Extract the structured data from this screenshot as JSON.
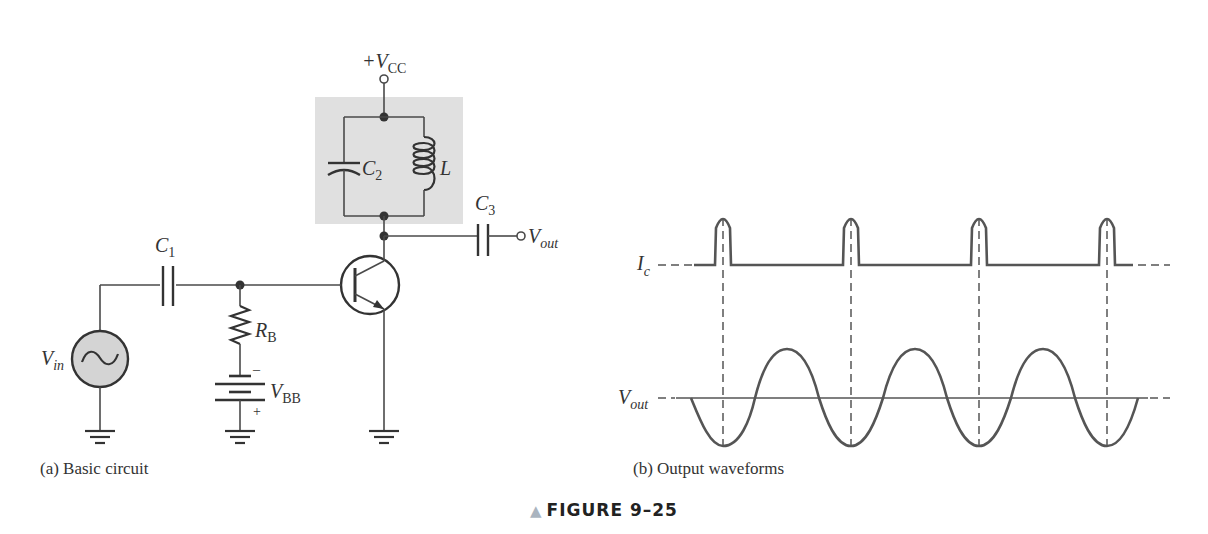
{
  "figure": {
    "title": "FIGURE 9–25",
    "marker_icon": "triangle-up-icon",
    "marker_color": "#aab4bf"
  },
  "circuit": {
    "caption": "(a) Basic circuit",
    "tank_fill": "#e0e0e0",
    "source_fill": "#d4d4d4",
    "labels": {
      "vcc_prefix": "+V",
      "vcc_sub": "CC",
      "c1": "C",
      "c1_sub": "1",
      "c2": "C",
      "c2_sub": "2",
      "c3": "C",
      "c3_sub": "3",
      "l": "L",
      "rb": "R",
      "rb_sub": "B",
      "vbb": "V",
      "vbb_sub": "BB",
      "vbb_minus": "–",
      "vbb_plus": "+",
      "vin": "V",
      "vin_sub": "in",
      "vout": "V",
      "vout_sub": "out"
    }
  },
  "waveforms": {
    "caption": "(b) Output waveforms",
    "ic_label": "I",
    "ic_sub": "c",
    "vout_label": "V",
    "vout_sub": "out",
    "pulse_count": 4
  }
}
